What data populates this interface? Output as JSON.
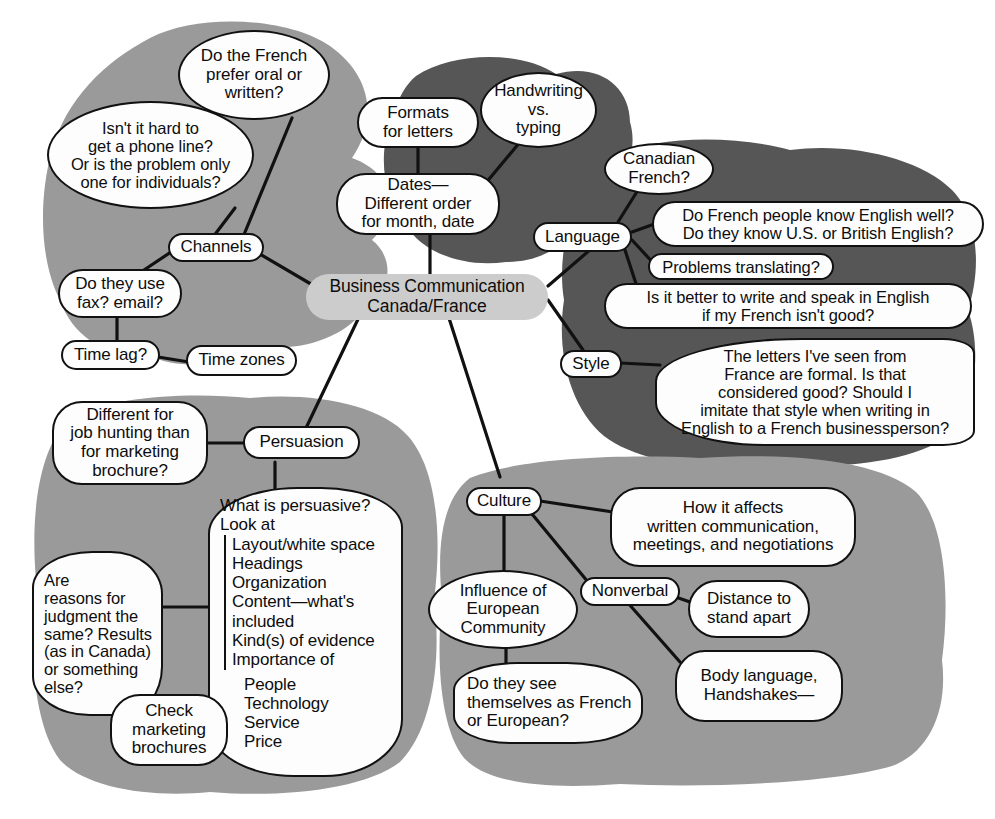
{
  "diagram": {
    "center": {
      "label": "Business Communication\nCanada/France"
    },
    "colors": {
      "light_blob": "#9a9a9a",
      "dark_blob": "#565656",
      "center_fill": "#cccccc",
      "node_fill": "#fdfdfd",
      "stroke": "#111111",
      "background": "#ffffff"
    },
    "branches": [
      {
        "key": "channels",
        "label": "Channels",
        "blob_shade": "light",
        "children": [
          "Do the French\nprefer oral or\nwritten?",
          "Isn't it hard to\nget a phone line?\nOr is the problem only\none for individuals?",
          "Do they use\nfax? email?",
          "Time lag?",
          "Time zones"
        ]
      },
      {
        "key": "formats",
        "label": "Dates—\nDifferent order\nfor month, date",
        "blob_shade": "dark",
        "children": [
          "Formats\nfor letters",
          "Handwriting\nvs.\ntyping"
        ]
      },
      {
        "key": "language",
        "label": "Language",
        "blob_shade": "dark",
        "children": [
          "Canadian\nFrench?",
          "Do French people know English well?\nDo they know U.S. or British English?",
          "Problems translating?",
          "Is it better to write and speak in English\nif my French isn't good?"
        ]
      },
      {
        "key": "style",
        "label": "Style",
        "blob_shade": "dark",
        "children": [
          "The letters I've seen from\nFrance are formal. Is that\nconsidered good? Should I\nimitate that style when writing in\nEnglish to a French businessperson?"
        ]
      },
      {
        "key": "persuasion",
        "label": "Persuasion",
        "blob_shade": "light",
        "children": [
          "Different for\njob hunting than\nfor marketing\nbrochure?",
          "Are\nreasons for\njudgment the\nsame? Results\n(as in Canada)\nor something\nelse?",
          "Check\nmarketing\nbrochures"
        ]
      },
      {
        "key": "culture",
        "label": "Culture",
        "blob_shade": "light",
        "children": [
          "How it affects\nwritten communication,\nmeetings, and negotiations",
          "Influence of\nEuropean\nCommunity",
          "Do they see\nthemselves as French\nor European?",
          "Nonverbal",
          "Distance to\nstand apart",
          "Body language,\nHandshakes—"
        ]
      }
    ],
    "nodes": {
      "do_the_french": "Do the French\nprefer oral or\nwritten?",
      "isnt_it_hard": "Isn't it hard to\nget a phone line?\nOr is the problem only\none for individuals?",
      "channels": "Channels",
      "do_they_use_fax": "Do they use\nfax? email?",
      "time_lag": "Time lag?",
      "time_zones": "Time zones",
      "formats_for_letters": "Formats\nfor letters",
      "handwriting": "Handwriting\nvs.\ntyping",
      "dates": "Dates—\nDifferent order\nfor month, date",
      "canadian_french": "Canadian\nFrench?",
      "language": "Language",
      "do_french_people": "Do French people know English well?\nDo they know U.S. or British English?",
      "problems_translating": "Problems translating?",
      "is_it_better": "Is it better to write and speak in English\nif my French isn't good?",
      "style": "Style",
      "the_letters": "The letters I've seen from\nFrance are formal. Is that\nconsidered good? Should I\nimitate that style when writing in\nEnglish to a French businessperson?",
      "different_for_job": "Different for\njob hunting than\nfor marketing\nbrochure?",
      "persuasion": "Persuasion",
      "are_reasons": "Are\nreasons for\njudgment the\nsame? Results\n(as in Canada)\nor something\nelse?",
      "check_marketing": "Check\nmarketing\nbrochures",
      "culture": "Culture",
      "how_it_affects": "How it affects\nwritten communication,\nmeetings, and negotiations",
      "influence_ec": "Influence of\nEuropean\nCommunity",
      "nonverbal": "Nonverbal",
      "distance_to_stand": "Distance to\nstand apart",
      "do_they_see": "Do they see\nthemselves as French\nor European?",
      "body_language": "Body language,\nHandshakes—"
    },
    "persuasive_list": {
      "head": "What is persuasive?\nLook at",
      "items": "Layout/white space\nHeadings\nOrganization\nContent—what's\nincluded\nKind(s) of evidence\nImportance of",
      "sub_items": "People\nTechnology\nService\nPrice"
    }
  }
}
